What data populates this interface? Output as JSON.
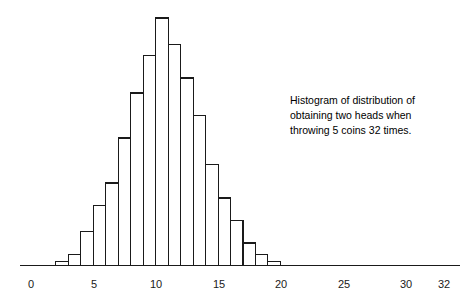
{
  "chart_data": {
    "type": "bar",
    "title": "",
    "xlabel": "",
    "ylabel": "",
    "grid": false,
    "legend": false,
    "axis": {
      "x_ticks": [
        "0",
        "5",
        "10",
        "15",
        "20",
        "25",
        "30",
        "32"
      ],
      "x_tick_values": [
        0,
        5,
        10,
        15,
        20,
        25,
        30,
        32
      ],
      "xlim": [
        0,
        32
      ],
      "y_axis_visible": false,
      "ylim": [
        0,
        68
      ]
    },
    "bin_width": 1,
    "categories": [
      2,
      3,
      4,
      5,
      6,
      7,
      8,
      9,
      10,
      11,
      12,
      13,
      14,
      15,
      16,
      17,
      18,
      19
    ],
    "values": [
      1,
      3,
      9,
      16,
      22,
      34,
      46,
      56,
      66,
      59,
      50,
      40,
      27,
      18,
      12,
      6,
      3,
      1
    ],
    "annotations": [
      {
        "name": "caption",
        "lines": [
          "Histogram of distribution of",
          "obtaining two heads when",
          "throwing 5 coins 32 times."
        ],
        "x": 290,
        "y": 104
      }
    ]
  },
  "colors": {
    "background": "#ffffff",
    "ink": "#1a1a1a",
    "bar_fill": "#ffffff",
    "bar_stroke": "#1a1a1a",
    "caption_text": "#000000"
  },
  "caption": {
    "line1": "Histogram of distribution of",
    "line2": "obtaining two heads when",
    "line3": "throwing 5 coins 32 times."
  },
  "ticks": {
    "t0": "0",
    "t1": "5",
    "t2": "10",
    "t3": "15",
    "t4": "20",
    "t5": "25",
    "t6": "30",
    "t7": "32"
  }
}
